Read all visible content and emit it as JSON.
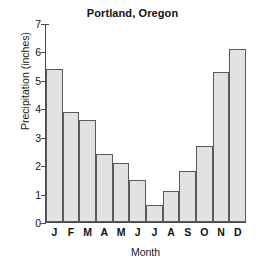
{
  "chart_data": {
    "type": "bar",
    "title": "Portland, Oregon",
    "xlabel": "Month",
    "ylabel": "Precipitation (inches)",
    "categories": [
      "J",
      "F",
      "M",
      "A",
      "M",
      "J",
      "J",
      "A",
      "S",
      "O",
      "N",
      "D"
    ],
    "category_names": [
      "January",
      "February",
      "March",
      "April",
      "May",
      "June",
      "July",
      "August",
      "September",
      "October",
      "November",
      "December"
    ],
    "values": [
      5.4,
      3.9,
      3.6,
      2.4,
      2.1,
      1.5,
      0.6,
      1.1,
      1.8,
      2.7,
      5.3,
      6.1
    ],
    "ylim": [
      0,
      7
    ],
    "ytick_labels": [
      "0",
      "1",
      "2",
      "3",
      "4",
      "5",
      "6",
      "7"
    ],
    "ytick_values": [
      0,
      1,
      2,
      3,
      4,
      5,
      6,
      7
    ],
    "grid": false,
    "legend": false,
    "bar_fill_color": "#e2e2e2",
    "bar_border_color": "#5a5a5a",
    "axis_color": "#4a4a4a",
    "background_color": "#ffffff"
  }
}
